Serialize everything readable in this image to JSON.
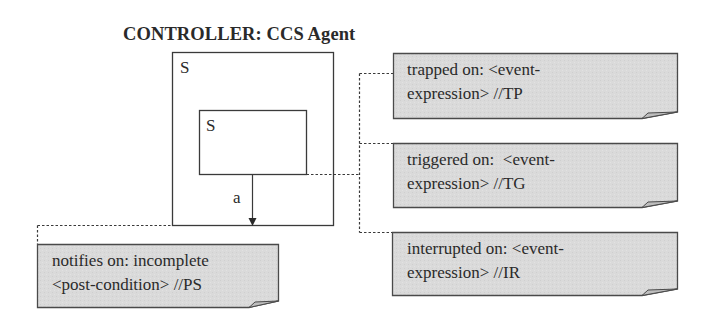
{
  "diagram": {
    "title": "CONTROLLER: CCS Agent",
    "outer_state": {
      "label": "S"
    },
    "inner_state": {
      "label": "S"
    },
    "transition": {
      "label": "a"
    },
    "notes": [
      {
        "id": "trapped",
        "line1": "trapped on: <event-",
        "line2": "expression> //TP"
      },
      {
        "id": "triggered",
        "line1": "triggered on:  <event-",
        "line2": "expression> //TG"
      },
      {
        "id": "interrupted",
        "line1": "interrupted on: <event-",
        "line2": "expression> //IR"
      },
      {
        "id": "notifies",
        "line1": "notifies on: incomplete",
        "line2": "<post-condition> //PS"
      }
    ],
    "colors": {
      "note_fill": "#d9d9d9",
      "note_border": "#4a4a4a",
      "line": "#3a3a3a"
    }
  }
}
